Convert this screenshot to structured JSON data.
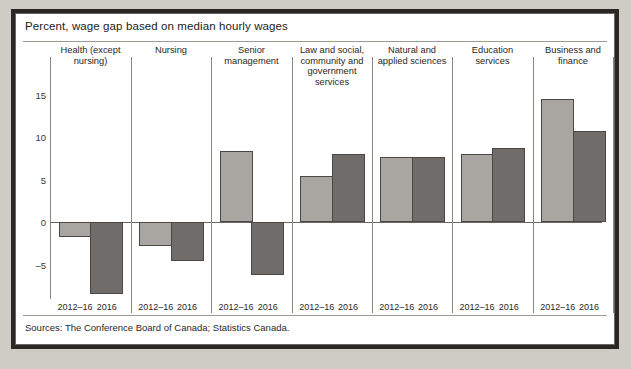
{
  "panel": {
    "title": "Percent, wage gap based on median hourly wages",
    "source": "Sources: The Conference Board of Canada; Statistics Canada."
  },
  "chart_data": {
    "type": "bar",
    "title": "Percent, wage gap based on median hourly wages",
    "xlabel": "",
    "ylabel": "Percent",
    "ylim": [
      -8.5,
      17
    ],
    "yticks": [
      15,
      10,
      5,
      0,
      -5
    ],
    "grid": false,
    "legend": "none",
    "categories": [
      "Health (except nursing)",
      "Nursing",
      "Senior management",
      "Law and social, community and government services",
      "Natural and applied sciences",
      "Education services",
      "Business and finance"
    ],
    "series": [
      {
        "name": "2012–16",
        "values": [
          -1.8,
          -2.8,
          8.3,
          5.4,
          7.7,
          8.0,
          14.5
        ]
      },
      {
        "name": "2016",
        "values": [
          -8.5,
          -4.6,
          -6.2,
          8.0,
          7.7,
          8.7,
          10.7
        ]
      }
    ],
    "tick_labels": [
      "2012–16",
      "2016"
    ],
    "colors": {
      "series_2012_16": "#a9a6a2",
      "series_2016": "#6f6c69",
      "outline": "#4a4744"
    },
    "notes": "Sources: The Conference Board of Canada; Statistics Canada."
  }
}
